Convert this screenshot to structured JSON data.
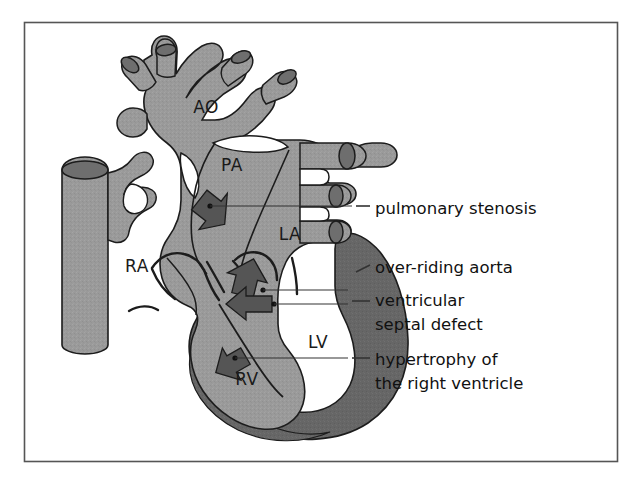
{
  "figure": {
    "border_color": "#555555",
    "background": "#ffffff",
    "colors": {
      "chamber_fill": "#9a9a9a",
      "myocardium_dark": "#666666",
      "vessel_end_dark": "#6e6e6e",
      "outline": "#1c1c1c",
      "arrow_fill": "#555555",
      "leader_line": "#333333",
      "text": "#111111"
    },
    "chamber_labels": [
      {
        "id": "ao",
        "text": "AO",
        "x": 206,
        "y": 113
      },
      {
        "id": "pa",
        "text": "PA",
        "x": 232,
        "y": 171
      },
      {
        "id": "la",
        "text": "LA",
        "x": 290,
        "y": 240
      },
      {
        "id": "ra",
        "text": "RA",
        "x": 137,
        "y": 272
      },
      {
        "id": "lv",
        "text": "LV",
        "x": 318,
        "y": 348
      },
      {
        "id": "rv",
        "text": "RV",
        "x": 247,
        "y": 385
      }
    ],
    "callouts": [
      {
        "id": "pulmonary-stenosis",
        "lines": [
          "pulmonary stenosis"
        ],
        "text_x": 375,
        "text_y": 214,
        "dot": {
          "x": 210,
          "y": 206
        },
        "leader": "M210,206 L366,206",
        "dash_x1": 355,
        "dash_x2": 369
      },
      {
        "id": "over-riding-aorta",
        "lines": [
          "over-riding aorta"
        ],
        "text_x": 375,
        "text_y": 273,
        "dot": {
          "x": 263,
          "y": 290
        },
        "leader": "M263,290 L352,290 L368,268",
        "dash_x1": 356,
        "dash_x2": 370
      },
      {
        "id": "ventricular-septal-defect",
        "lines": [
          "ventricular",
          "septal defect"
        ],
        "text_x": 375,
        "text_y": 306,
        "line_height": 24,
        "dot": {
          "x": 274,
          "y": 304
        },
        "leader": "M274,304 L366,304",
        "dash_x1": 352,
        "dash_x2": 370
      },
      {
        "id": "hypertrophy-right-ventricle",
        "lines": [
          "hypertrophy of",
          "the right ventricle"
        ],
        "text_x": 375,
        "text_y": 365,
        "line_height": 24,
        "dot": {
          "x": 235,
          "y": 358
        },
        "leader": "M235,358 L366,358",
        "dash_x1": 352,
        "dash_x2": 370
      }
    ]
  }
}
